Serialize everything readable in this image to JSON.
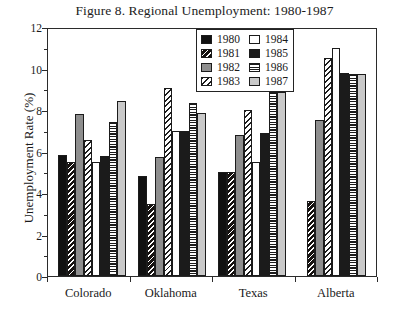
{
  "chart_data": {
    "type": "bar",
    "title": "Figure 8. Regional Unemployment: 1980-1987",
    "xlabel": "",
    "ylabel": "Unemployment Rate (%)",
    "ylim": [
      0,
      12
    ],
    "yticks": [
      0,
      2,
      4,
      6,
      8,
      10,
      12
    ],
    "ytick_labels": [
      "0",
      "2",
      "4",
      "6",
      "8",
      "10",
      "12"
    ],
    "yticks_minor": [
      1,
      3,
      5,
      7,
      9,
      11
    ],
    "grid": false,
    "legend_position": "top-center-inside",
    "categories": [
      "Colorado",
      "Oklahoma",
      "Texas",
      "Alberta"
    ],
    "series": [
      {
        "name": "1980",
        "pattern": "solid-black",
        "values": [
          5.85,
          4.8,
          5.0,
          null
        ]
      },
      {
        "name": "1981",
        "pattern": "diagonal-on-black",
        "values": [
          5.5,
          3.45,
          5.0,
          3.6
        ]
      },
      {
        "name": "1982",
        "pattern": "solid-gray",
        "values": [
          7.8,
          5.75,
          6.8,
          7.5
        ]
      },
      {
        "name": "1983",
        "pattern": "diagonal-on-white",
        "values": [
          6.55,
          9.05,
          8.0,
          10.5
        ]
      },
      {
        "name": "1984",
        "pattern": "white",
        "values": [
          5.5,
          7.0,
          5.5,
          11.0
        ]
      },
      {
        "name": "1985",
        "pattern": "solid-black",
        "values": [
          5.8,
          7.0,
          6.9,
          9.8
        ]
      },
      {
        "name": "1986",
        "pattern": "horizontal-stripes",
        "values": [
          7.4,
          8.35,
          8.85,
          9.75
        ]
      },
      {
        "name": "1987",
        "pattern": "light-gray",
        "values": [
          8.45,
          7.85,
          8.85,
          9.75
        ]
      }
    ]
  },
  "legend": {
    "column_left": [
      "1980",
      "1981",
      "1982",
      "1983"
    ],
    "column_right": [
      "1984",
      "1985",
      "1986",
      "1987"
    ]
  },
  "colors": {
    "axis": "#2b2b2b",
    "series_1980": "#111111",
    "series_1982": "#8e8e8e",
    "series_1985": "#1b1b1b",
    "series_1987": "#c9c9c9",
    "background": "#ffffff"
  }
}
